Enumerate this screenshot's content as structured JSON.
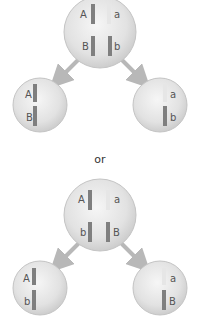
{
  "diagram": {
    "type": "meiosis-independent-assortment",
    "separator_label": "or",
    "colors": {
      "cell_fill_center": "#f4f4f4",
      "cell_fill_edge": "#cfcfcf",
      "cell_stroke": "#c4c4c4",
      "dominant_chromosome": "#7f7f7f",
      "recessive_chromosome": "#e6e6e6",
      "arrow": "#b8b8b8",
      "label": "#555555"
    },
    "scenario_1": {
      "parent": {
        "labels": [
          "A",
          "a",
          "B",
          "b"
        ]
      },
      "left_child": {
        "labels": [
          "A",
          "B"
        ]
      },
      "right_child": {
        "labels": [
          "a",
          "b"
        ]
      }
    },
    "scenario_2": {
      "parent": {
        "labels": [
          "A",
          "a",
          "b",
          "B"
        ]
      },
      "left_child": {
        "labels": [
          "A",
          "b"
        ]
      },
      "right_child": {
        "labels": [
          "a",
          "B"
        ]
      }
    }
  }
}
